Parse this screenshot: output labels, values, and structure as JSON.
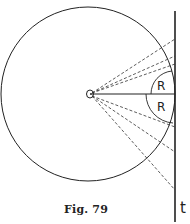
{
  "figure": {
    "caption": "Fig. 79",
    "line_label": "t",
    "arc_labels": [
      "R",
      "R"
    ],
    "colors": {
      "ink": "#222222",
      "background": "#ffffff"
    }
  }
}
